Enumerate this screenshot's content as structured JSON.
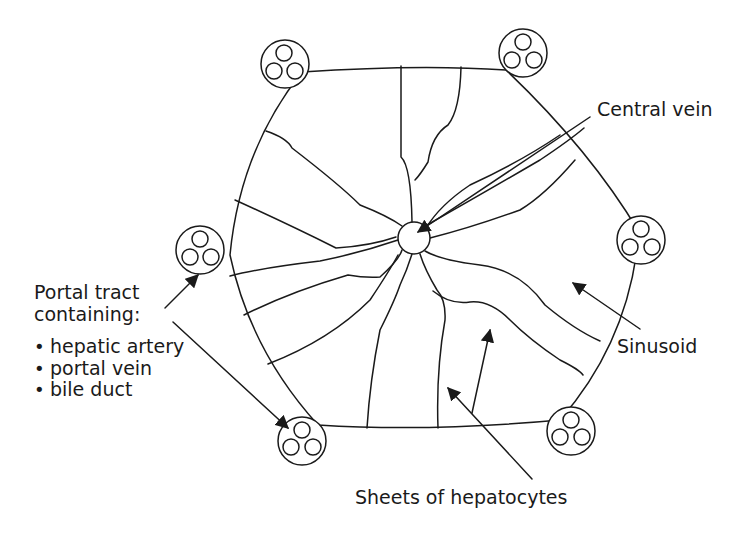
{
  "diagram": {
    "type": "liver-lobule",
    "stroke_color": "#1a1a1a",
    "background": "#ffffff"
  },
  "labels": {
    "central_vein": "Central vein",
    "sinusoid": "Sinusoid",
    "sheets": "Sheets of hepatocytes",
    "portal_title_line1": "Portal tract",
    "portal_title_line2": "containing:",
    "portal_items": [
      "hepatic artery",
      "portal vein",
      "bile duct"
    ]
  }
}
